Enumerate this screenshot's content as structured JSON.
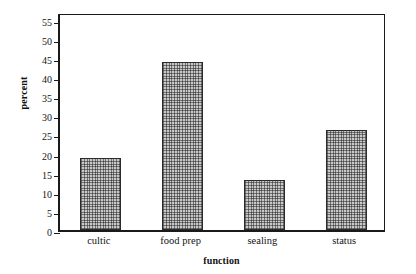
{
  "chart_data": {
    "type": "bar",
    "title": "",
    "xlabel": "function",
    "ylabel": "percent",
    "categories": [
      "cultic",
      "food prep",
      "sealing",
      "status"
    ],
    "values": [
      18.7,
      43.8,
      13.2,
      26.2
    ],
    "ylim": [
      0,
      57
    ],
    "yticks": [
      0,
      5,
      10,
      15,
      20,
      25,
      30,
      35,
      40,
      45,
      50,
      55
    ],
    "ytick_labels": [
      "0",
      "5",
      "10",
      "15",
      "20",
      "25",
      "30",
      "35",
      "40",
      "45",
      "50",
      "55"
    ],
    "grid": false,
    "legend": null,
    "bar_fill": "#c9c9c9",
    "bar_edge": "#2b2b2b",
    "axis_color": "#1a1a1a",
    "background": "#ffffff"
  }
}
